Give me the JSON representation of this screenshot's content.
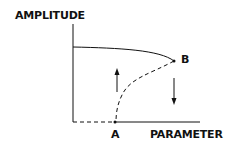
{
  "diagram": {
    "y_axis_label": "AMPLITUDE",
    "x_axis_label": "PARAMETER",
    "points": [
      {
        "id": "A",
        "label": "A"
      },
      {
        "id": "B",
        "label": "B"
      }
    ],
    "curves": [
      {
        "name": "upper-stable-branch",
        "style": "solid"
      },
      {
        "name": "unstable-branch",
        "style": "dashed"
      },
      {
        "name": "lower-branch-left",
        "style": "dashed"
      },
      {
        "name": "lower-branch-right",
        "style": "solid"
      }
    ],
    "arrows": [
      {
        "name": "jump-up-arrow",
        "direction": "up"
      },
      {
        "name": "jump-down-arrow",
        "direction": "down"
      }
    ],
    "colors": {
      "ink": "#111111",
      "background": "#ffffff"
    }
  }
}
